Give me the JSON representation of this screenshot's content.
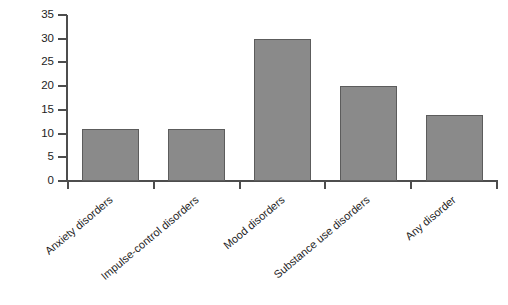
{
  "chart_data": {
    "type": "bar",
    "title": "",
    "xlabel": "",
    "ylabel": "Median age of onset",
    "categories": [
      "Anxiety disorders",
      "Impulse-control disorders",
      "Mood disorders",
      "Substance use disorders",
      "Any disorder"
    ],
    "values": [
      11,
      11,
      30,
      20,
      14
    ],
    "ylim": [
      0,
      35
    ],
    "ytick_labels": [
      "0",
      "5",
      "10",
      "15",
      "20",
      "25",
      "30",
      "35"
    ],
    "ytick_values": [
      0,
      5,
      10,
      15,
      20,
      25,
      30,
      35
    ],
    "grid": false,
    "legend": null,
    "bar_color": "#8a8a8a",
    "bar_border_color": "#5c5c5c",
    "axis_color": "#4d4d4d",
    "background_color": "#ffffff",
    "text_color": "#1d1d1d"
  }
}
